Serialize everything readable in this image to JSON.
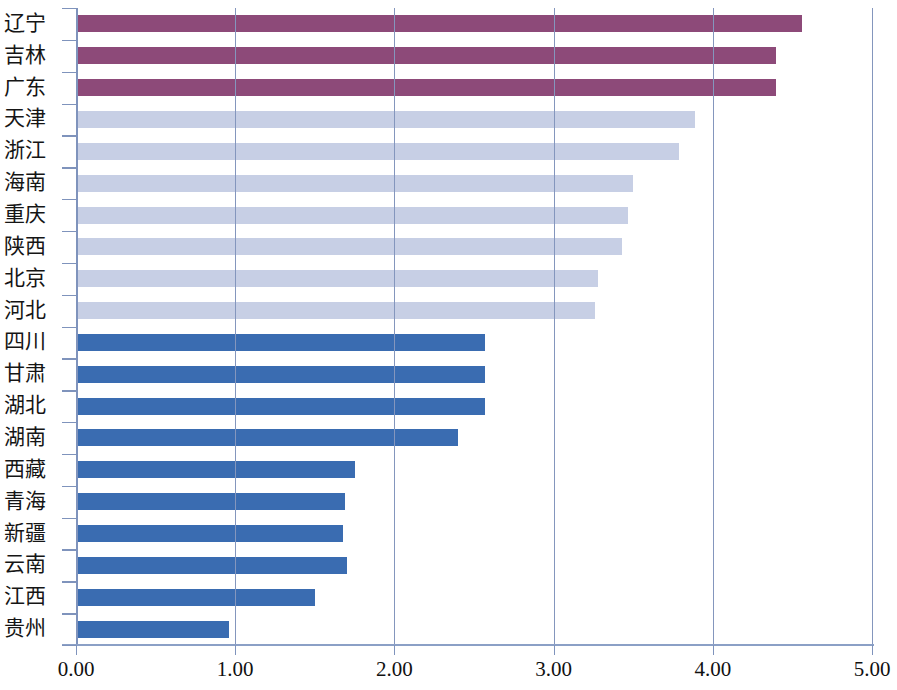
{
  "chart_data": {
    "type": "bar",
    "orientation": "horizontal",
    "title": "",
    "subtitle": "",
    "xlabel": "",
    "ylabel": "",
    "xlim": [
      0.0,
      5.0
    ],
    "xticks": [
      0.0,
      1.0,
      2.0,
      3.0,
      4.0,
      5.0
    ],
    "xtick_labels": [
      "0.00",
      "1.00",
      "2.00",
      "3.00",
      "4.00",
      "5.00"
    ],
    "grid": "vertical",
    "legend": "none",
    "categories": [
      "辽宁",
      "吉林",
      "广东",
      "天津",
      "浙江",
      "海南",
      "重庆",
      "陕西",
      "北京",
      "河北",
      "四川",
      "甘肃",
      "湖北",
      "湖南",
      "西藏",
      "青海",
      "新疆",
      "云南",
      "江西",
      "贵州"
    ],
    "values": [
      4.56,
      4.4,
      4.4,
      3.89,
      3.79,
      3.5,
      3.47,
      3.43,
      3.28,
      3.26,
      2.57,
      2.57,
      2.57,
      2.4,
      1.75,
      1.69,
      1.68,
      1.7,
      1.5,
      0.96
    ],
    "bar_colors": [
      "#8d4a79",
      "#8d4a79",
      "#8d4a79",
      "#c7cfe5",
      "#c7cfe5",
      "#c7cfe5",
      "#c7cfe5",
      "#c7cfe5",
      "#c7cfe5",
      "#c7cfe5",
      "#3a6cb1",
      "#3a6cb1",
      "#3a6cb1",
      "#3a6cb1",
      "#3a6cb1",
      "#3a6cb1",
      "#3a6cb1",
      "#3a6cb1",
      "#3a6cb1",
      "#3a6cb1"
    ],
    "color_groups": [
      {
        "name": "group-high",
        "color": "#8d4a79",
        "categories": [
          "辽宁",
          "吉林",
          "广东"
        ]
      },
      {
        "name": "group-mid",
        "color": "#c7cfe5",
        "categories": [
          "天津",
          "浙江",
          "海南",
          "重庆",
          "陕西",
          "北京",
          "河北"
        ]
      },
      {
        "name": "group-low",
        "color": "#3a6cb1",
        "categories": [
          "四川",
          "甘肃",
          "湖北",
          "湖南",
          "西藏",
          "青海",
          "新疆",
          "云南",
          "江西",
          "贵州"
        ]
      }
    ]
  },
  "axis_colors": {
    "gridline": "#8496bd",
    "axis": "#7f93bc",
    "text": "#111111"
  }
}
